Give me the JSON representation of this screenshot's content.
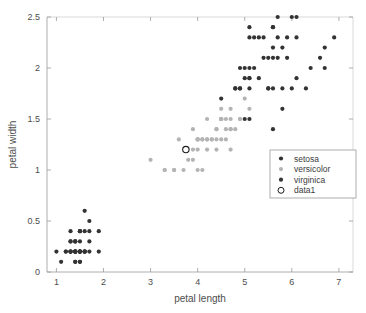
{
  "chart_data": {
    "type": "scatter",
    "title": "",
    "xlabel": "petal length",
    "ylabel": "petal width",
    "xlim": [
      0.8,
      7.3
    ],
    "ylim": [
      0,
      2.5
    ],
    "xticks": [
      1,
      2,
      3,
      4,
      5,
      6,
      7
    ],
    "xticklabels": [
      "1",
      "2",
      "3",
      "4",
      "5",
      "6",
      "7"
    ],
    "yticks": [
      0,
      0.5,
      1,
      1.5,
      2,
      2.5
    ],
    "yticklabels": [
      "0",
      "0.5",
      "1",
      "1.5",
      "2",
      "2.5"
    ],
    "grid": false,
    "legend_position": "center-right",
    "series": [
      {
        "name": "setosa",
        "color": "#333333",
        "marker": "filled-circle",
        "points": [
          [
            1.4,
            0.2
          ],
          [
            1.4,
            0.2
          ],
          [
            1.3,
            0.2
          ],
          [
            1.5,
            0.2
          ],
          [
            1.4,
            0.2
          ],
          [
            1.7,
            0.4
          ],
          [
            1.4,
            0.3
          ],
          [
            1.5,
            0.2
          ],
          [
            1.4,
            0.2
          ],
          [
            1.5,
            0.1
          ],
          [
            1.5,
            0.2
          ],
          [
            1.6,
            0.2
          ],
          [
            1.4,
            0.1
          ],
          [
            1.1,
            0.1
          ],
          [
            1.2,
            0.2
          ],
          [
            1.5,
            0.4
          ],
          [
            1.3,
            0.4
          ],
          [
            1.4,
            0.3
          ],
          [
            1.7,
            0.3
          ],
          [
            1.5,
            0.3
          ],
          [
            1.7,
            0.2
          ],
          [
            1.5,
            0.4
          ],
          [
            1.0,
            0.2
          ],
          [
            1.7,
            0.5
          ],
          [
            1.9,
            0.2
          ],
          [
            1.6,
            0.2
          ],
          [
            1.6,
            0.4
          ],
          [
            1.5,
            0.2
          ],
          [
            1.4,
            0.2
          ],
          [
            1.6,
            0.2
          ],
          [
            1.6,
            0.2
          ],
          [
            1.5,
            0.4
          ],
          [
            1.5,
            0.1
          ],
          [
            1.4,
            0.2
          ],
          [
            1.5,
            0.2
          ],
          [
            1.2,
            0.2
          ],
          [
            1.3,
            0.2
          ],
          [
            1.4,
            0.1
          ],
          [
            1.3,
            0.2
          ],
          [
            1.5,
            0.2
          ],
          [
            1.3,
            0.3
          ],
          [
            1.3,
            0.3
          ],
          [
            1.3,
            0.2
          ],
          [
            1.6,
            0.6
          ],
          [
            1.9,
            0.4
          ],
          [
            1.4,
            0.3
          ],
          [
            1.6,
            0.2
          ],
          [
            1.4,
            0.2
          ],
          [
            1.5,
            0.2
          ],
          [
            1.4,
            0.2
          ]
        ]
      },
      {
        "name": "versicolor",
        "color": "#b4b4b4",
        "marker": "filled-circle",
        "points": [
          [
            4.7,
            1.4
          ],
          [
            4.5,
            1.5
          ],
          [
            4.9,
            1.5
          ],
          [
            4.0,
            1.3
          ],
          [
            4.6,
            1.5
          ],
          [
            4.5,
            1.3
          ],
          [
            4.7,
            1.6
          ],
          [
            3.3,
            1.0
          ],
          [
            4.6,
            1.3
          ],
          [
            3.9,
            1.4
          ],
          [
            3.5,
            1.0
          ],
          [
            4.2,
            1.5
          ],
          [
            4.0,
            1.0
          ],
          [
            4.7,
            1.4
          ],
          [
            3.6,
            1.3
          ],
          [
            4.4,
            1.4
          ],
          [
            4.5,
            1.5
          ],
          [
            4.1,
            1.0
          ],
          [
            4.5,
            1.5
          ],
          [
            3.9,
            1.1
          ],
          [
            4.8,
            1.8
          ],
          [
            4.0,
            1.3
          ],
          [
            4.9,
            1.5
          ],
          [
            4.7,
            1.2
          ],
          [
            4.3,
            1.3
          ],
          [
            4.4,
            1.4
          ],
          [
            4.8,
            1.4
          ],
          [
            5.0,
            1.7
          ],
          [
            4.5,
            1.5
          ],
          [
            3.5,
            1.0
          ],
          [
            3.8,
            1.1
          ],
          [
            3.7,
            1.0
          ],
          [
            3.9,
            1.2
          ],
          [
            5.1,
            1.6
          ],
          [
            4.5,
            1.5
          ],
          [
            4.5,
            1.6
          ],
          [
            4.7,
            1.5
          ],
          [
            4.4,
            1.3
          ],
          [
            4.1,
            1.3
          ],
          [
            4.0,
            1.3
          ],
          [
            4.4,
            1.2
          ],
          [
            4.6,
            1.4
          ],
          [
            4.0,
            1.2
          ],
          [
            3.3,
            1.0
          ],
          [
            4.2,
            1.3
          ],
          [
            4.2,
            1.2
          ],
          [
            4.2,
            1.3
          ],
          [
            4.3,
            1.3
          ],
          [
            3.0,
            1.1
          ],
          [
            4.1,
            1.3
          ]
        ]
      },
      {
        "name": "virginica",
        "color": "#333333",
        "marker": "filled-circle",
        "points": [
          [
            6.0,
            2.5
          ],
          [
            5.1,
            1.9
          ],
          [
            5.9,
            2.1
          ],
          [
            5.6,
            1.8
          ],
          [
            5.8,
            2.2
          ],
          [
            6.6,
            2.1
          ],
          [
            4.5,
            1.7
          ],
          [
            6.3,
            1.8
          ],
          [
            5.8,
            1.8
          ],
          [
            6.1,
            2.5
          ],
          [
            5.1,
            2.0
          ],
          [
            5.3,
            1.9
          ],
          [
            5.5,
            2.1
          ],
          [
            5.0,
            2.0
          ],
          [
            5.1,
            2.4
          ],
          [
            5.3,
            2.3
          ],
          [
            5.5,
            1.8
          ],
          [
            6.7,
            2.2
          ],
          [
            6.9,
            2.3
          ],
          [
            5.0,
            1.5
          ],
          [
            5.7,
            2.3
          ],
          [
            4.9,
            2.0
          ],
          [
            6.7,
            2.0
          ],
          [
            4.9,
            1.8
          ],
          [
            5.7,
            2.1
          ],
          [
            6.0,
            1.8
          ],
          [
            4.8,
            1.8
          ],
          [
            4.9,
            1.8
          ],
          [
            5.6,
            2.1
          ],
          [
            5.8,
            1.6
          ],
          [
            6.1,
            1.9
          ],
          [
            6.4,
            2.0
          ],
          [
            5.6,
            2.2
          ],
          [
            5.1,
            1.5
          ],
          [
            5.6,
            1.4
          ],
          [
            6.1,
            2.3
          ],
          [
            5.6,
            2.4
          ],
          [
            5.5,
            1.8
          ],
          [
            4.8,
            1.8
          ],
          [
            5.4,
            2.1
          ],
          [
            5.6,
            2.4
          ],
          [
            5.1,
            2.3
          ],
          [
            5.1,
            1.9
          ],
          [
            5.9,
            2.3
          ],
          [
            5.7,
            2.5
          ],
          [
            5.2,
            2.3
          ],
          [
            5.0,
            1.9
          ],
          [
            5.2,
            2.0
          ],
          [
            5.4,
            2.3
          ],
          [
            5.1,
            1.8
          ]
        ]
      },
      {
        "name": "data1",
        "color": "#1a1a1a",
        "marker": "open-circle",
        "points": [
          [
            3.75,
            1.2
          ]
        ]
      }
    ],
    "legend_entries": [
      {
        "label": "setosa",
        "color": "#333333",
        "marker": "filled-circle"
      },
      {
        "label": "versicolor",
        "color": "#b4b4b4",
        "marker": "filled-circle"
      },
      {
        "label": "virginica",
        "color": "#333333",
        "marker": "filled-circle"
      },
      {
        "label": "data1",
        "color": "#1a1a1a",
        "marker": "open-circle"
      }
    ]
  }
}
